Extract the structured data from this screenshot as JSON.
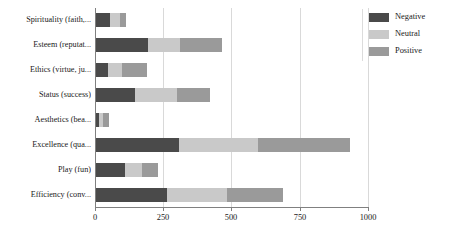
{
  "chart_data": {
    "type": "bar",
    "orientation": "horizontal",
    "stacked": true,
    "title": "",
    "subtitle": "",
    "xlabel": "",
    "ylabel": "",
    "xlim": [
      0,
      1000
    ],
    "xticks": [
      0,
      250,
      500,
      750,
      1000
    ],
    "xtick_labels": [
      "0",
      "250",
      "500",
      "750",
      "1000"
    ],
    "grid": true,
    "grid_axis": "x",
    "legend_position": "right",
    "categories": [
      "Spirituality (faith,...",
      "Esteem (reputat...",
      "Ethics (virtue, ju...",
      "Status (success)",
      "Aesthetics (bea...",
      "Excellence (qua...",
      "Play (fun)",
      "Efficiency (conv..."
    ],
    "series": [
      {
        "name": "Negative",
        "color": "#4a4a4a",
        "values": [
          55,
          194,
          48,
          147,
          15,
          308,
          110,
          264
        ]
      },
      {
        "name": "Neutral",
        "color": "#c9c9c9",
        "values": [
          37,
          117,
          51,
          154,
          15,
          289,
          62,
          220
        ]
      },
      {
        "name": "Positive",
        "color": "#9a9a9a",
        "values": [
          22,
          154,
          92,
          121,
          22,
          337,
          59,
          205
        ]
      }
    ],
    "totals": [
      114,
      465,
      191,
      422,
      52,
      934,
      231,
      689
    ]
  },
  "legend": {
    "entries": [
      {
        "label": "Negative",
        "color": "#4a4a4a"
      },
      {
        "label": "Neutral",
        "color": "#c9c9c9"
      },
      {
        "label": "Positive",
        "color": "#9a9a9a"
      }
    ]
  },
  "axis": {
    "x_tick_labels": [
      "0",
      "250",
      "500",
      "750",
      "1000"
    ]
  }
}
